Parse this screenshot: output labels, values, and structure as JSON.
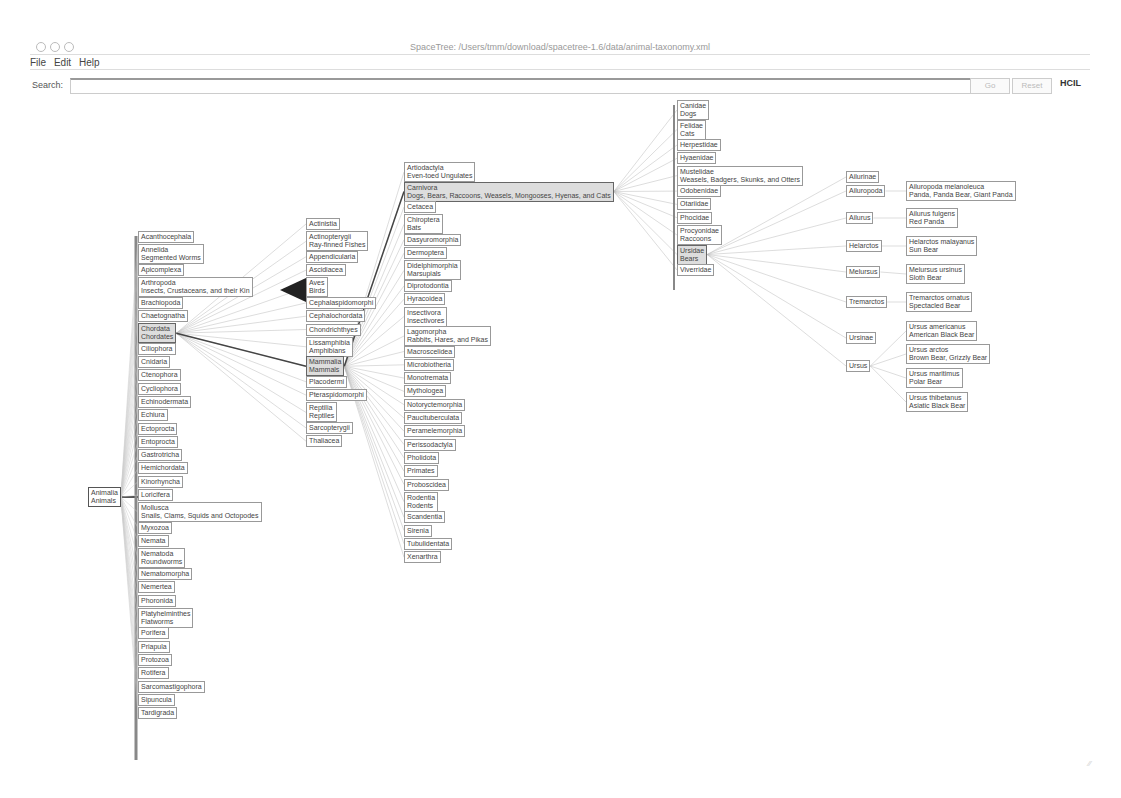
{
  "window": {
    "title": "SpaceTree: /Users/tmm/download/spacetree-1.6/data/animal-taxonomy.xml"
  },
  "menu": [
    "File",
    "Edit",
    "Help"
  ],
  "search": {
    "label": "Search:",
    "value": "",
    "go_label": "Go",
    "reset_label": "Reset",
    "logo": "HCIL"
  },
  "tree": {
    "root": {
      "name": "Animalia",
      "common": "Animals"
    },
    "phyla": [
      {
        "name": "Acanthocephala"
      },
      {
        "name": "Annelida",
        "common": "Segmented Worms"
      },
      {
        "name": "Apicomplexa"
      },
      {
        "name": "Arthropoda",
        "common": "Insects, Crustaceans, and their Kin"
      },
      {
        "name": "Brachiopoda"
      },
      {
        "name": "Chaetognatha"
      },
      {
        "name": "Chordata",
        "common": "Chordates",
        "selected": true
      },
      {
        "name": "Ciliophora"
      },
      {
        "name": "Cnidaria"
      },
      {
        "name": "Ctenophora"
      },
      {
        "name": "Cycliophora"
      },
      {
        "name": "Echinodermata"
      },
      {
        "name": "Echiura"
      },
      {
        "name": "Ectoprocta"
      },
      {
        "name": "Entoprocta"
      },
      {
        "name": "Gastrotricha"
      },
      {
        "name": "Hemichordata"
      },
      {
        "name": "Kinorhyncha"
      },
      {
        "name": "Loricifera"
      },
      {
        "name": "Mollusca",
        "common": "Snails, Clams, Squids and Octopodes"
      },
      {
        "name": "Myxozoa"
      },
      {
        "name": "Nemata"
      },
      {
        "name": "Nematoda",
        "common": "Roundworms"
      },
      {
        "name": "Nematomorpha"
      },
      {
        "name": "Nemertea"
      },
      {
        "name": "Phoronida"
      },
      {
        "name": "Platyhelminthes",
        "common": "Flatworms"
      },
      {
        "name": "Porifera"
      },
      {
        "name": "Priapula"
      },
      {
        "name": "Protozoa"
      },
      {
        "name": "Rotifera"
      },
      {
        "name": "Sarcomastigophora"
      },
      {
        "name": "Sipuncula"
      },
      {
        "name": "Tardigrada"
      }
    ],
    "classes": [
      {
        "name": "Actinistia"
      },
      {
        "name": "Actinopterygii",
        "common": "Ray-finned Fishes"
      },
      {
        "name": "Appendicularia"
      },
      {
        "name": "Ascidiacea"
      },
      {
        "name": "Aves",
        "common": "Birds"
      },
      {
        "name": "Cephalaspidomorphi"
      },
      {
        "name": "Cephalochordata"
      },
      {
        "name": "Chondrichthyes"
      },
      {
        "name": "Lissamphibia",
        "common": "Amphibians"
      },
      {
        "name": "Mammalia",
        "common": "Mammals",
        "selected": true
      },
      {
        "name": "Placodermi"
      },
      {
        "name": "Pteraspidomorphi"
      },
      {
        "name": "Reptilia",
        "common": "Reptiles"
      },
      {
        "name": "Sarcopterygii"
      },
      {
        "name": "Thaliacea"
      }
    ],
    "orders": [
      {
        "name": "Artiodactyla",
        "common": "Even-toed Ungulates"
      },
      {
        "name": "Carnivora",
        "common": "Dogs, Bears, Raccoons, Weasels, Mongooses, Hyenas, and Cats",
        "selected": true
      },
      {
        "name": "Cetacea"
      },
      {
        "name": "Chiroptera",
        "common": "Bats"
      },
      {
        "name": "Dasyuromorphia"
      },
      {
        "name": "Dermoptera"
      },
      {
        "name": "Didelphimorphia",
        "common": "Marsupials"
      },
      {
        "name": "Diprotodontia"
      },
      {
        "name": "Hyracoidea"
      },
      {
        "name": "Insectivora",
        "common": "Insectivores"
      },
      {
        "name": "Lagomorpha",
        "common": "Rabbits, Hares, and Pikas"
      },
      {
        "name": "Macroscelidea"
      },
      {
        "name": "Microbiotheria"
      },
      {
        "name": "Monotremata"
      },
      {
        "name": "Mythologea"
      },
      {
        "name": "Notoryctemorphia"
      },
      {
        "name": "Paucituberculata"
      },
      {
        "name": "Peramelemorphia"
      },
      {
        "name": "Perissodactyla"
      },
      {
        "name": "Pholidota"
      },
      {
        "name": "Primates"
      },
      {
        "name": "Proboscidea"
      },
      {
        "name": "Rodentia",
        "common": "Rodents"
      },
      {
        "name": "Scandentia"
      },
      {
        "name": "Sirenia"
      },
      {
        "name": "Tubulidentata"
      },
      {
        "name": "Xenarthra"
      }
    ],
    "families": [
      {
        "name": "Canidae",
        "common": "Dogs"
      },
      {
        "name": "Felidae",
        "common": "Cats"
      },
      {
        "name": "Herpestidae"
      },
      {
        "name": "Hyaenidae"
      },
      {
        "name": "Mustelidae",
        "common": "Weasels, Badgers, Skunks, and Otters"
      },
      {
        "name": "Odobenidae"
      },
      {
        "name": "Otariidae"
      },
      {
        "name": "Phocidae"
      },
      {
        "name": "Procyonidae",
        "common": "Raccoons"
      },
      {
        "name": "Ursidae",
        "common": "Bears",
        "selected": true
      },
      {
        "name": "Viverridae"
      }
    ],
    "genera": [
      {
        "name": "Ailurinae"
      },
      {
        "name": "Ailuropoda"
      },
      {
        "name": "Ailurus"
      },
      {
        "name": "Helarctos"
      },
      {
        "name": "Melursus"
      },
      {
        "name": "Tremarctos"
      },
      {
        "name": "Ursinae"
      },
      {
        "name": "Ursus"
      }
    ],
    "species": [
      {
        "name": "Ailuropoda melanoleuca",
        "common": "Panda, Panda Bear, Giant Panda"
      },
      {
        "name": "Ailurus fulgens",
        "common": "Red Panda"
      },
      {
        "name": "Helarctos malayanus",
        "common": "Sun Bear"
      },
      {
        "name": "Melursus ursinus",
        "common": "Sloth Bear"
      },
      {
        "name": "Tremarctos ornatus",
        "common": "Spectacled Bear"
      },
      {
        "name": "Ursus americanus",
        "common": "American Black Bear"
      },
      {
        "name": "Ursus arctos",
        "common": "Brown Bear, Grizzly Bear"
      },
      {
        "name": "Ursus maritimus",
        "common": "Polar Bear"
      },
      {
        "name": "Ursus thibetanus",
        "common": "Asiatic Black Bear"
      }
    ]
  }
}
